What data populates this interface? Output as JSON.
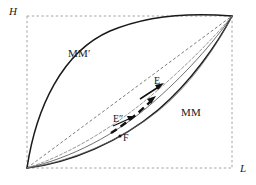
{
  "figure": {
    "background_color": "#ffffff",
    "ink_color": "#1a1a1a",
    "guide_color": "#8c8c8c",
    "axes": {
      "vertical_label": "H",
      "horizontal_label": "L"
    },
    "curves": [
      {
        "name": "MM'",
        "label": "MM′",
        "style": "solid",
        "position": "upper-left bulge"
      },
      {
        "name": "MM",
        "label": "MM",
        "style": "solid",
        "position": "lower-right bulge"
      }
    ],
    "points": [
      {
        "name": "E",
        "label": "E"
      },
      {
        "name": "E2",
        "label": "E″"
      },
      {
        "name": "F",
        "label": "F"
      }
    ],
    "guides": {
      "bounding_box": "dashed",
      "diagonal": "dashed"
    }
  }
}
